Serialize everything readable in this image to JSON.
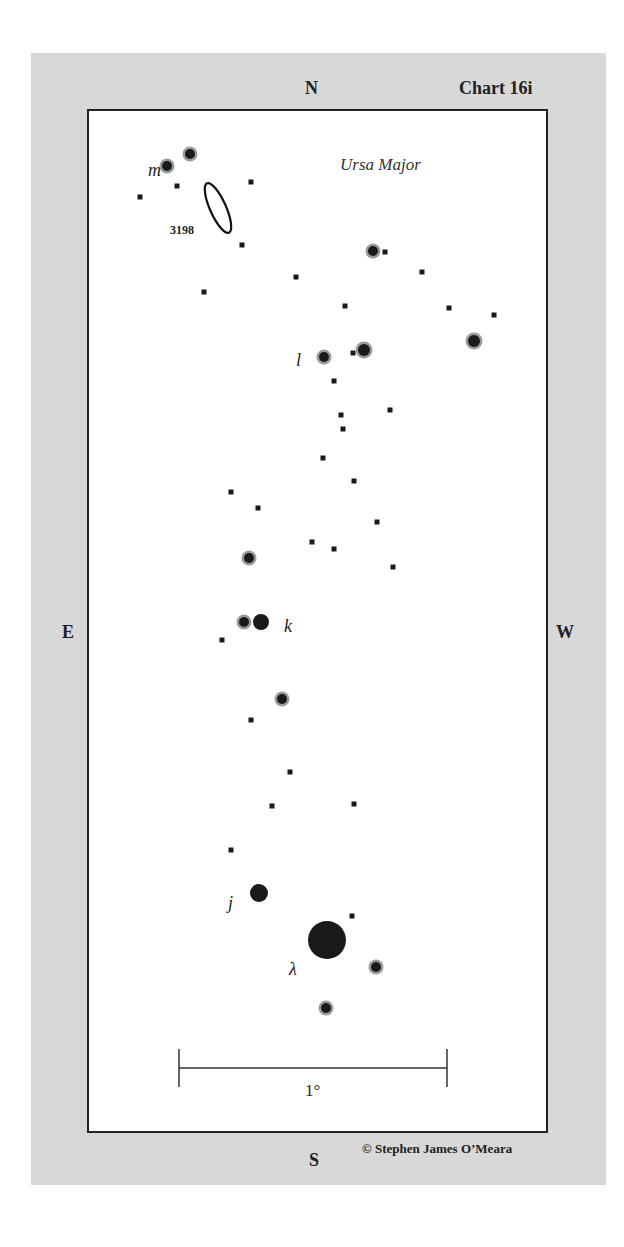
{
  "chart": {
    "title": "Chart 16i",
    "constellation": "Ursa Major",
    "credit": "© Stephen James O’Meara",
    "compass": {
      "north": "N",
      "south": "S",
      "east": "E",
      "west": "W"
    },
    "scale_label": "1°"
  },
  "colors": {
    "panel": "#d8d8d8",
    "frame": "#222222",
    "star": "#1a1a1a",
    "halo": "#9a9a9a"
  },
  "objects": {
    "galaxy": {
      "label": "3198",
      "cx": 218,
      "cy": 208,
      "rx": 8,
      "ry": 27,
      "angle": -24
    },
    "star_labels": [
      {
        "text": "m",
        "x": 148,
        "y": 176
      },
      {
        "text": "l",
        "x": 296,
        "y": 366
      },
      {
        "text": "k",
        "x": 284,
        "y": 632
      },
      {
        "text": "j",
        "x": 228,
        "y": 909
      },
      {
        "text": "λ",
        "x": 289,
        "y": 975
      }
    ],
    "stars": [
      {
        "x": 167,
        "y": 166,
        "r": 5,
        "halo": true
      },
      {
        "x": 190,
        "y": 154,
        "r": 5,
        "halo": true
      },
      {
        "x": 373,
        "y": 251,
        "r": 5,
        "halo": true
      },
      {
        "x": 474,
        "y": 341,
        "r": 6,
        "halo": true
      },
      {
        "x": 324,
        "y": 357,
        "r": 5,
        "halo": true
      },
      {
        "x": 364,
        "y": 350,
        "r": 6,
        "halo": true
      },
      {
        "x": 249,
        "y": 558,
        "r": 5,
        "halo": true
      },
      {
        "x": 244,
        "y": 622,
        "r": 5,
        "halo": true
      },
      {
        "x": 261,
        "y": 622,
        "r": 8,
        "halo": false
      },
      {
        "x": 282,
        "y": 699,
        "r": 5,
        "halo": true
      },
      {
        "x": 259,
        "y": 893,
        "r": 9,
        "halo": false
      },
      {
        "x": 327,
        "y": 940,
        "r": 19,
        "halo": false
      },
      {
        "x": 376,
        "y": 967,
        "r": 5,
        "halo": true
      },
      {
        "x": 326,
        "y": 1008,
        "r": 5,
        "halo": true
      }
    ],
    "faint_stars": [
      [
        140,
        197
      ],
      [
        177,
        186
      ],
      [
        251,
        182
      ],
      [
        242,
        245
      ],
      [
        204,
        292
      ],
      [
        385,
        252
      ],
      [
        422,
        272
      ],
      [
        296,
        277
      ],
      [
        345,
        306
      ],
      [
        449,
        308
      ],
      [
        494,
        315
      ],
      [
        353,
        353
      ],
      [
        334,
        381
      ],
      [
        341,
        415
      ],
      [
        343,
        429
      ],
      [
        390,
        410
      ],
      [
        323,
        458
      ],
      [
        354,
        481
      ],
      [
        231,
        492
      ],
      [
        258,
        508
      ],
      [
        377,
        522
      ],
      [
        312,
        542
      ],
      [
        334,
        549
      ],
      [
        393,
        567
      ],
      [
        222,
        640
      ],
      [
        251,
        720
      ],
      [
        290,
        772
      ],
      [
        272,
        806
      ],
      [
        354,
        804
      ],
      [
        231,
        850
      ],
      [
        352,
        916
      ]
    ],
    "scale_bar": {
      "x1": 179,
      "x2": 447,
      "y": 1068,
      "tick_top": 1049,
      "tick_bottom": 1087
    }
  }
}
